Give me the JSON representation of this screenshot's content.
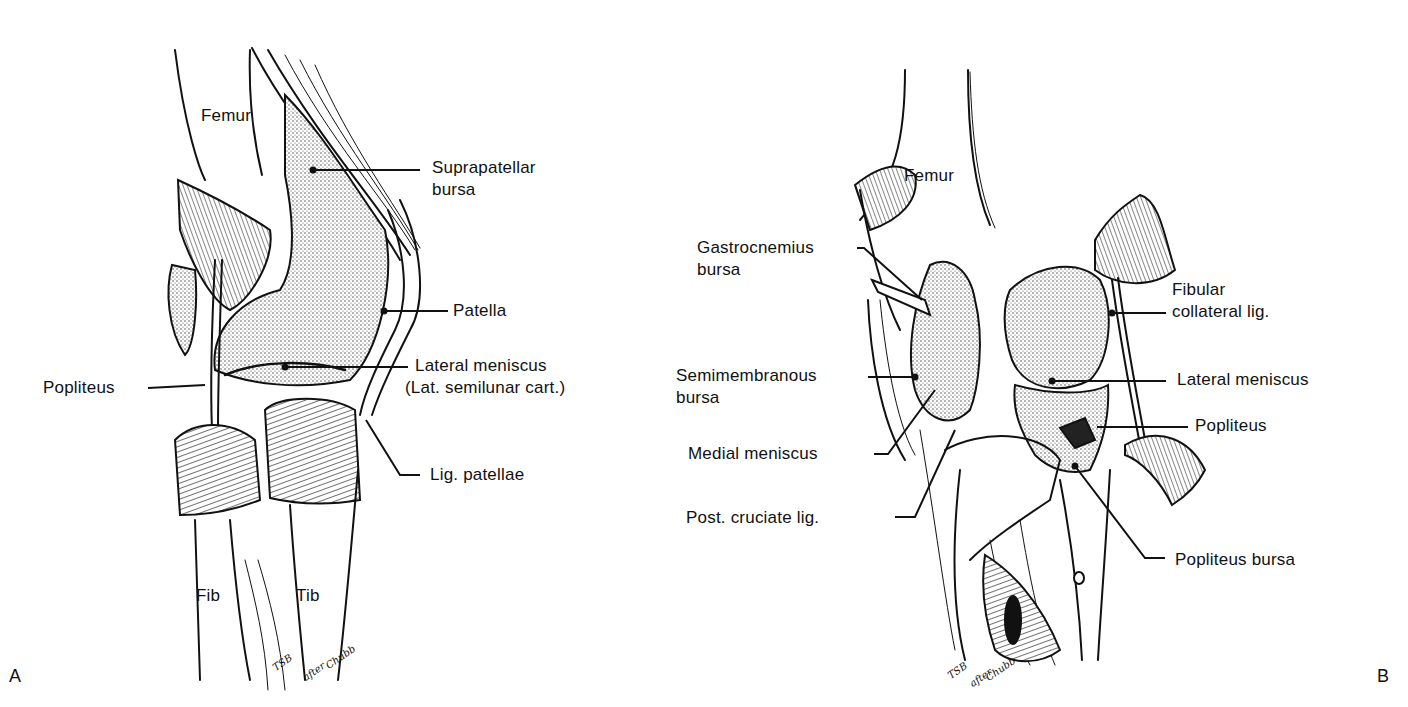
{
  "figure": {
    "panels": [
      {
        "letter": "A",
        "view": "lateral view of knee",
        "labels": {
          "femur": "Femur",
          "suprapatellar_l1": "Suprapatellar",
          "suprapatellar_l2": "bursa",
          "patella": "Patella",
          "popliteus": "Popliteus",
          "lateral_meniscus_l1": "Lateral meniscus",
          "lateral_meniscus_l2": "(Lat. semilunar cart.)",
          "lig_patellae": "Lig. patellae",
          "fib": "Fib",
          "tib": "Tib"
        },
        "signature": {
          "initials": "TSB",
          "after": "after",
          "source": "Chubb"
        }
      },
      {
        "letter": "B",
        "view": "posterior view of knee",
        "labels": {
          "femur": "Femur",
          "gastrocnemius_l1": "Gastrocnemius",
          "gastrocnemius_l2": "bursa",
          "fibular_l1": "Fibular",
          "fibular_l2": "collateral lig.",
          "semimembranous_l1": "Semimembranous",
          "semimembranous_l2": "bursa",
          "lateral_meniscus": "Lateral meniscus",
          "popliteus": "Popliteus",
          "medial_meniscus": "Medial meniscus",
          "post_cruciate": "Post. cruciate lig.",
          "popliteus_bursa": "Popliteus bursa"
        },
        "signature": {
          "initials": "TSB",
          "after": "after",
          "source": "Chubb"
        }
      }
    ],
    "colors": {
      "ink": "#111111",
      "stipple": "#9a9a9a",
      "background": "#ffffff"
    }
  }
}
